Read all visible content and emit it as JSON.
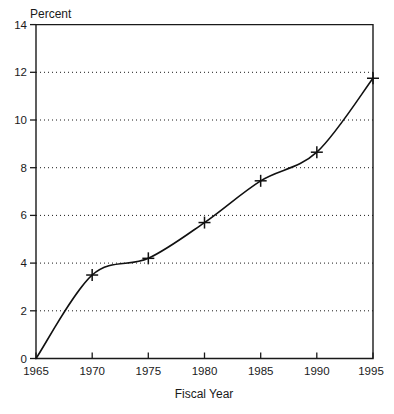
{
  "chart_data": {
    "type": "line",
    "title": "",
    "ylabel": "Percent",
    "xlabel": "Fiscal Year",
    "x": [
      1965,
      1970,
      1975,
      1980,
      1985,
      1990,
      1995
    ],
    "values": [
      0,
      3.5,
      4.2,
      5.7,
      7.45,
      8.65,
      11.75
    ],
    "series": [
      {
        "name": "Percent",
        "values": [
          0,
          3.5,
          4.2,
          5.7,
          7.45,
          8.65,
          11.75
        ]
      }
    ],
    "xlim": [
      1965,
      1995
    ],
    "ylim": [
      0,
      14
    ],
    "ytick_labels": [
      "0",
      "2",
      "4",
      "6",
      "8",
      "10",
      "12",
      "14"
    ],
    "yticks": [
      0,
      2,
      4,
      6,
      8,
      10,
      12,
      14
    ],
    "xtick_labels": [
      "1965",
      "1970",
      "1975",
      "1980",
      "1985",
      "1990",
      "1995"
    ],
    "xticks": [
      1965,
      1970,
      1975,
      1980,
      1985,
      1990,
      1995
    ],
    "grid": "horizontal-dotted",
    "legend": "none",
    "marker": "plus",
    "line_color": "#111111",
    "grid_color": "#1a1a1a",
    "background": "#ffffff",
    "annotations": []
  },
  "labels": {
    "y_axis_title": "Percent",
    "x_axis_title": "Fiscal Year"
  }
}
